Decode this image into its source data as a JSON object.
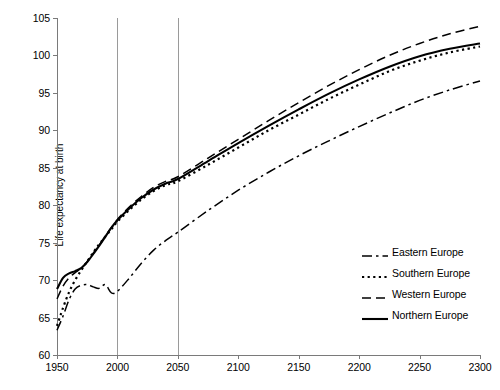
{
  "chart_data": {
    "type": "line",
    "title": "",
    "xlabel": "",
    "ylabel": "Life expectancy at birth",
    "xlim": [
      1950,
      2300
    ],
    "ylim": [
      60,
      105
    ],
    "xticks": [
      1950,
      2000,
      2050,
      2100,
      2150,
      2200,
      2250,
      2300
    ],
    "yticks": [
      60,
      65,
      70,
      75,
      80,
      85,
      90,
      95,
      100,
      105
    ],
    "grid": "vertical gridlines at 2000 and 2050 only",
    "gridlines_x": [
      2000,
      2050
    ],
    "legend_position": "lower right",
    "x": [
      1950,
      1955,
      1960,
      1965,
      1970,
      1975,
      1980,
      1985,
      1990,
      1995,
      2000,
      2010,
      2020,
      2030,
      2040,
      2050,
      2075,
      2100,
      2125,
      2150,
      2175,
      2200,
      2225,
      2250,
      2275,
      2300
    ],
    "series": [
      {
        "name": "Eastern Europe",
        "style": "dash-dot",
        "values": [
          63.3,
          65.2,
          67.4,
          68.8,
          69.3,
          69.4,
          69.1,
          68.9,
          69.4,
          68.3,
          68.5,
          70.3,
          72.3,
          74.0,
          75.3,
          76.4,
          79.3,
          82.0,
          84.4,
          86.6,
          88.6,
          90.5,
          92.3,
          94.0,
          95.4,
          96.6
        ]
      },
      {
        "name": "Southern Europe",
        "style": "dotted",
        "values": [
          63.9,
          66.3,
          68.4,
          70.0,
          71.3,
          72.5,
          73.7,
          74.8,
          75.8,
          76.8,
          77.8,
          79.4,
          80.8,
          81.9,
          82.7,
          83.2,
          85.4,
          87.7,
          90.0,
          92.1,
          94.2,
          96.1,
          97.9,
          99.3,
          100.4,
          101.2
        ]
      },
      {
        "name": "Western Europe",
        "style": "dashed",
        "values": [
          67.5,
          69.2,
          70.3,
          71.0,
          71.6,
          72.5,
          73.6,
          74.7,
          75.9,
          77.0,
          78.1,
          79.8,
          81.2,
          82.4,
          83.2,
          83.8,
          86.3,
          88.8,
          91.3,
          93.7,
          96.0,
          98.1,
          100.0,
          101.6,
          102.9,
          103.9
        ]
      },
      {
        "name": "Northern Europe",
        "style": "solid",
        "values": [
          68.8,
          70.3,
          70.9,
          71.2,
          71.6,
          72.4,
          73.5,
          74.6,
          75.8,
          77.0,
          78.0,
          79.6,
          81.0,
          82.1,
          82.9,
          83.5,
          85.9,
          88.3,
          90.6,
          92.8,
          94.9,
          96.8,
          98.5,
          99.9,
          100.9,
          101.6
        ]
      }
    ]
  }
}
